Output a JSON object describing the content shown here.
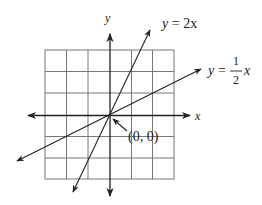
{
  "diagram": {
    "axes": {
      "x_label": "x",
      "y_label": "y"
    },
    "grid": {
      "cols": 6,
      "rows": 6
    },
    "lines": [
      {
        "label_lhs": "y",
        "label_eq": "=",
        "label_rhs": "2x",
        "slope": 2
      },
      {
        "label_lhs": "y",
        "label_eq": "=",
        "frac_num": "1",
        "frac_den": "2",
        "label_var": "x",
        "slope": 0.5
      }
    ],
    "origin_label": "(0, 0)"
  }
}
